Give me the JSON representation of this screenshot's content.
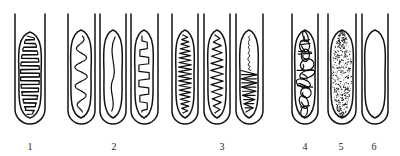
{
  "figure": {
    "background_color": "#ffffff",
    "ink_color": "#141414",
    "width": 400,
    "height": 156,
    "tube_count": 9,
    "label_count": 6
  },
  "labels": [
    {
      "id": "label-1",
      "text": "1",
      "x": 30,
      "y": 150
    },
    {
      "id": "label-2",
      "text": "2",
      "x": 114,
      "y": 150
    },
    {
      "id": "label-3",
      "text": "3",
      "x": 222,
      "y": 150
    },
    {
      "id": "label-4",
      "text": "4",
      "x": 305,
      "y": 150
    },
    {
      "id": "label-5",
      "text": "5",
      "x": 341,
      "y": 150
    },
    {
      "id": "label-6",
      "text": "6",
      "x": 374,
      "y": 150
    }
  ],
  "tubes": [
    {
      "id": "tube-1a",
      "group": "1",
      "name": "dense-horizontal-hatch-tube",
      "content_pattern": "dense-horizontal-zigzag",
      "description": "Broad ovoid body filled with densely packed horizontal zigzag hatching",
      "wall_left": 15,
      "wall_right": 45,
      "wall_top": 14,
      "bottom_y": 124,
      "body_cx": 30,
      "body_top": 32,
      "body_bottom": 118,
      "body_rx": 11,
      "fill_style": "zigzag-horizontal",
      "zigzag_rows": 21
    },
    {
      "id": "tube-2a",
      "group": "2",
      "name": "large-wave-tube",
      "content_pattern": "large-amplitude-vertical-wave",
      "description": "Narrow ovoid body containing one large sinuous vertical wave",
      "wall_left": 68,
      "wall_right": 95,
      "wall_top": 14,
      "bottom_y": 124,
      "body_cx": 81,
      "body_top": 30,
      "body_bottom": 118,
      "body_rx": 10,
      "fill_style": "wave-large",
      "wave_cycles": 4
    },
    {
      "id": "tube-2b",
      "group": "2",
      "name": "single-s-curve-tube",
      "content_pattern": "single-s-curve",
      "description": "Narrow ovoid body with one slack S-shaped line down the middle",
      "wall_left": 100,
      "wall_right": 126,
      "wall_top": 14,
      "bottom_y": 124,
      "body_cx": 113,
      "body_top": 30,
      "body_bottom": 118,
      "body_rx": 9,
      "fill_style": "s-curve",
      "wave_cycles": 1
    },
    {
      "id": "tube-2c",
      "group": "2",
      "name": "stepped-wave-tube",
      "content_pattern": "squared-stepped-wave",
      "description": "Narrow ovoid body with an angular squared-off meander",
      "wall_left": 131,
      "wall_right": 158,
      "wall_top": 14,
      "bottom_y": 124,
      "body_cx": 144,
      "body_top": 30,
      "body_bottom": 118,
      "body_rx": 9,
      "fill_style": "wave-stepped",
      "wave_cycles": 5
    },
    {
      "id": "tube-3a",
      "group": "3",
      "name": "fine-sawtooth-tube-a",
      "content_pattern": "fine-vertical-sawtooth",
      "description": "Narrow ovoid body filled with a tight high-frequency sawtooth",
      "wall_left": 172,
      "wall_right": 198,
      "wall_top": 14,
      "bottom_y": 124,
      "body_cx": 185,
      "body_top": 30,
      "body_bottom": 118,
      "body_rx": 9,
      "fill_style": "sawtooth-fine",
      "wave_cycles": 17
    },
    {
      "id": "tube-3b",
      "group": "3",
      "name": "fine-sawtooth-tube-b",
      "content_pattern": "medium-vertical-sawtooth",
      "description": "Narrow ovoid body filled with a medium-frequency sawtooth",
      "wall_left": 204,
      "wall_right": 230,
      "wall_top": 14,
      "bottom_y": 124,
      "body_cx": 217,
      "body_top": 30,
      "body_bottom": 118,
      "body_rx": 9,
      "fill_style": "sawtooth-medium",
      "wave_cycles": 11
    },
    {
      "id": "tube-3c",
      "group": "3",
      "name": "split-thread-sawtooth-tube",
      "content_pattern": "thin-thread-over-basal-zigzag",
      "description": "Thin straight thread in the upper half, dense horizontal zigzag mass in the lower half",
      "wall_left": 236,
      "wall_right": 263,
      "wall_top": 14,
      "bottom_y": 124,
      "body_cx": 249,
      "body_top": 30,
      "body_bottom": 118,
      "body_rx": 9,
      "fill_style": "thread-plus-basal-zigzag",
      "zigzag_rows": 10
    },
    {
      "id": "tube-4",
      "group": "4",
      "name": "tangled-scribble-tube",
      "content_pattern": "tangled-loop-scribble",
      "description": "Ovoid body crammed with irregular interlocking loops and knots",
      "wall_left": 292,
      "wall_right": 318,
      "wall_top": 14,
      "bottom_y": 124,
      "body_cx": 305,
      "body_top": 30,
      "body_bottom": 118,
      "body_rx": 10,
      "fill_style": "tangle",
      "loop_count": 9
    },
    {
      "id": "tube-5",
      "group": "5",
      "name": "stippled-tube",
      "content_pattern": "fine-stipple",
      "description": "Ovoid body filled uniformly with fine granular stipple",
      "wall_left": 328,
      "wall_right": 356,
      "wall_top": 14,
      "bottom_y": 124,
      "body_cx": 342,
      "body_top": 30,
      "body_bottom": 118,
      "body_rx": 11,
      "fill_style": "stipple",
      "dot_count": 520
    },
    {
      "id": "tube-6",
      "group": "6",
      "name": "empty-tube",
      "content_pattern": "empty",
      "description": "Ovoid body left entirely blank",
      "wall_left": 362,
      "wall_right": 388,
      "wall_top": 14,
      "bottom_y": 124,
      "body_cx": 375,
      "body_top": 30,
      "body_bottom": 118,
      "body_rx": 10,
      "fill_style": "none"
    }
  ]
}
